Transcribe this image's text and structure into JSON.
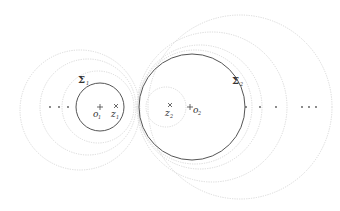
{
  "diagram": {
    "left_cluster": {
      "label": "Σ",
      "label_sub": "1",
      "center_label": "o",
      "center_sub": "1",
      "point_label": "z",
      "point_sub": "1",
      "ellipsis": "· · ·"
    },
    "right_cluster": {
      "label": "Σ",
      "label_sub": "2",
      "center_label": "o",
      "center_sub": "2",
      "point_label": "z",
      "point_sub": "2",
      "ellipsis_inner": "· · ·",
      "ellipsis_outer": "· · ·"
    },
    "colors": {
      "solid_circle": "#555555",
      "dotted_circle": "#d4d4d4",
      "text": "#333333"
    }
  }
}
